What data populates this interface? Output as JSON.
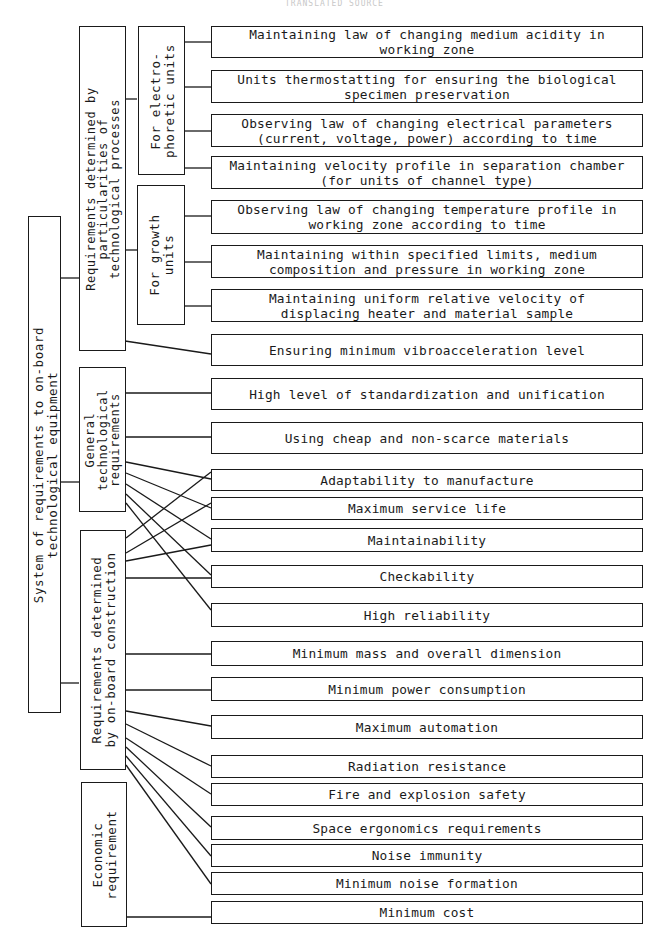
{
  "header": {
    "text": "TRANSLATED SOURCE"
  },
  "root": {
    "label": "System of requirements to on-board\ntechnological equipment"
  },
  "groups": {
    "process": {
      "label": "Requirements determined by\nparticularities of\ntechnological processes"
    },
    "electrophoretic": {
      "label": "For electro-\nphoretic units"
    },
    "growth": {
      "label": "For growth\nunits"
    },
    "general": {
      "label": "General\ntechnological\nrequirements"
    },
    "construction": {
      "label": "Requirements determined\nby on-board construction"
    },
    "economic": {
      "label": "Economic\nrequirement"
    }
  },
  "requirements": [
    {
      "label": "Maintaining law of changing medium acidity in\nworking zone"
    },
    {
      "label": "Units thermostatting for ensuring the biological\nspecimen preservation"
    },
    {
      "label": "Observing law of changing electrical parameters\n(current, voltage, power) according to time"
    },
    {
      "label": "Maintaining velocity profile in separation chamber\n(for units of channel type)"
    },
    {
      "label": "Observing law of changing temperature profile in\nworking zone according to time"
    },
    {
      "label": "Maintaining within specified limits, medium\ncomposition and pressure in working zone"
    },
    {
      "label": "Maintaining uniform relative velocity of\ndisplacing heater and material sample"
    },
    {
      "label": "Ensuring minimum vibroacceleration level"
    },
    {
      "label": "High level of standardization and unification"
    },
    {
      "label": "Using cheap and non-scarce materials"
    },
    {
      "label": "Adaptability to manufacture"
    },
    {
      "label": "Maximum service life"
    },
    {
      "label": "Maintainability"
    },
    {
      "label": "Checkability"
    },
    {
      "label": "High reliability"
    },
    {
      "label": "Minimum mass and overall dimension"
    },
    {
      "label": "Minimum power consumption"
    },
    {
      "label": "Maximum automation"
    },
    {
      "label": "Radiation resistance"
    },
    {
      "label": "Fire and explosion safety"
    },
    {
      "label": "Space ergonomics requirements"
    },
    {
      "label": "Noise immunity"
    },
    {
      "label": "Minimum noise formation"
    },
    {
      "label": "Minimum cost"
    }
  ],
  "colors": {
    "line": "#1a1a1a",
    "background": "#ffffff"
  }
}
